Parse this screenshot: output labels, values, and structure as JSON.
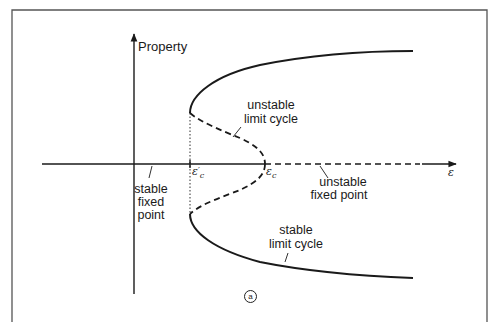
{
  "figure": {
    "panel_label": "a",
    "axes": {
      "y_label": "Property",
      "x_label": "ε"
    },
    "ticks": {
      "eps_c_prime": {
        "symbol": "ε",
        "subscript": "c",
        "prime": "′"
      },
      "eps_c": {
        "symbol": "ε",
        "subscript": "c"
      }
    },
    "annotations": {
      "unstable_limit_cycle": [
        "unstable",
        "limit cycle"
      ],
      "stable_fixed_point": [
        "stable",
        "fixed",
        "point"
      ],
      "unstable_fixed_point": [
        "unstable",
        "fixed point"
      ],
      "stable_limit_cycle": [
        "stable",
        "limit cycle"
      ]
    },
    "colors": {
      "ink": "#1a1a1a",
      "frame": "#555555",
      "background": "#ffffff"
    }
  }
}
